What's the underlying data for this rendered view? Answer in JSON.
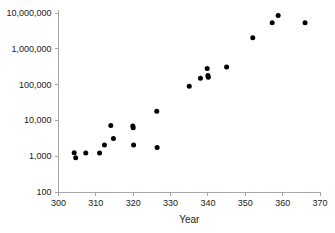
{
  "chart_data": {
    "type": "scatter",
    "title": "",
    "xlabel": "Year",
    "ylabel": "",
    "xlim": [
      300,
      370
    ],
    "ylim": [
      100,
      10000000
    ],
    "yscale": "log",
    "grid": false,
    "legend": null,
    "xticks": [
      300,
      310,
      320,
      330,
      340,
      350,
      360,
      370
    ],
    "xtick_labels": [
      "300",
      "310",
      "320",
      "330",
      "340",
      "350",
      "360",
      "370"
    ],
    "yticks": [
      100,
      1000,
      10000,
      100000,
      1000000,
      10000000
    ],
    "ytick_labels": [
      "100",
      "1,000",
      "10,000",
      "100,000",
      "1,000,000",
      "10,000,000"
    ],
    "marker": "circle",
    "marker_color": "#000000",
    "axis_color": "#a6a6a6",
    "points": [
      {
        "x": 304.2,
        "y": 1250
      },
      {
        "x": 304.6,
        "y": 900
      },
      {
        "x": 307.3,
        "y": 1230
      },
      {
        "x": 311.0,
        "y": 1220
      },
      {
        "x": 312.3,
        "y": 2050
      },
      {
        "x": 314.0,
        "y": 7200
      },
      {
        "x": 314.7,
        "y": 3100
      },
      {
        "x": 319.9,
        "y": 7000
      },
      {
        "x": 320.0,
        "y": 6200
      },
      {
        "x": 320.1,
        "y": 2050
      },
      {
        "x": 326.3,
        "y": 18000
      },
      {
        "x": 326.4,
        "y": 1750
      },
      {
        "x": 335.0,
        "y": 90000
      },
      {
        "x": 338.0,
        "y": 150000
      },
      {
        "x": 339.8,
        "y": 280000
      },
      {
        "x": 340.0,
        "y": 180000
      },
      {
        "x": 340.1,
        "y": 160000
      },
      {
        "x": 345.0,
        "y": 310000
      },
      {
        "x": 352.0,
        "y": 2050000
      },
      {
        "x": 357.2,
        "y": 5300000
      },
      {
        "x": 358.8,
        "y": 8500000
      },
      {
        "x": 366.0,
        "y": 5300000
      }
    ]
  },
  "axes": {
    "x_title": "Year"
  }
}
